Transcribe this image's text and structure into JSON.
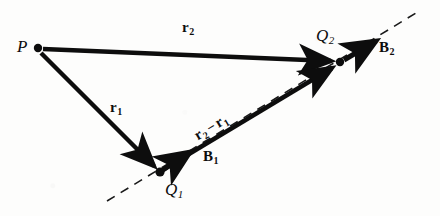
{
  "figure": {
    "kind": "vector-diagram",
    "caption": "",
    "background_color": "#fdfdfc",
    "ink_color": "#0d0d0d",
    "width": 440,
    "height": 216
  },
  "points": {
    "p": {
      "label": "P",
      "sub": "",
      "x": 38,
      "y": 48,
      "label_x": 17,
      "label_y": 38,
      "dot": true
    },
    "q1": {
      "label": "Q",
      "sub": "1",
      "x": 160,
      "y": 172,
      "label_x": 165,
      "label_y": 181,
      "dot": true
    },
    "q2": {
      "label": "Q",
      "sub": "2",
      "x": 340,
      "y": 62,
      "label_x": 316,
      "label_y": 27,
      "dot": true
    }
  },
  "vectors": {
    "r1": {
      "label": "r",
      "sub": "1",
      "from": "P",
      "to": "Q1",
      "x1": 41,
      "y1": 53,
      "x2": 158,
      "y2": 170,
      "label_x": 110,
      "label_y": 100,
      "width": 4.2,
      "head": "solid"
    },
    "r2": {
      "label": "r",
      "sub": "2",
      "from": "P",
      "to": "Q2",
      "x1": 43,
      "y1": 49,
      "x2": 337,
      "y2": 62,
      "label_x": 182,
      "label_y": 20,
      "width": 4.2,
      "head": "solid"
    },
    "rdiff": {
      "label": "r",
      "sub": "2",
      "op": "−",
      "label2": "r",
      "sub2": "1",
      "from": "Q1",
      "to": "Q2",
      "x1": 163,
      "y1": 170,
      "x2": 337,
      "y2": 65,
      "label_x": 196,
      "label_y": 129,
      "label_rotation": -31,
      "width": 4.2,
      "head": "solid"
    },
    "b1": {
      "label": "B",
      "sub": "1",
      "from": "Q1",
      "x1": 160,
      "y1": 172,
      "x2": 197,
      "y2": 147,
      "label_x": 203,
      "label_y": 149,
      "width": 4.6,
      "head": "solid"
    },
    "b2": {
      "label": "B",
      "sub": "2",
      "from": "Q2",
      "x1": 344,
      "y1": 60,
      "x2": 383,
      "y2": 36,
      "label_x": 379,
      "label_y": 40,
      "width": 4.6,
      "head": "solid"
    }
  },
  "dashed_line": {
    "name": "line-through-q1-q2",
    "x1": 107,
    "y1": 201,
    "x2": 416,
    "y2": 13,
    "dash": "9 7",
    "width": 1.6
  }
}
